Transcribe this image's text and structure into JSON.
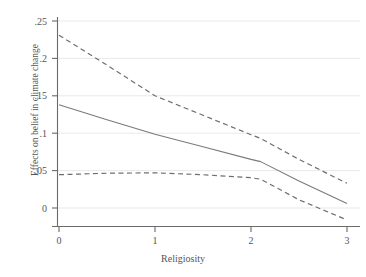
{
  "chart_data": {
    "type": "line",
    "title": "",
    "xlabel": "Religiosity",
    "ylabel": "Effects on belief in climate change",
    "xlim": [
      -0.06,
      3.06
    ],
    "ylim": [
      -0.028,
      0.2585
    ],
    "grid": true,
    "legend": "none",
    "xticks": [
      0,
      1,
      2,
      3
    ],
    "xticklabels": [
      "0",
      "1",
      "2",
      "3"
    ],
    "yticks": [
      0,
      0.05,
      0.1,
      0.15,
      0.2,
      0.25
    ],
    "yticklabels": [
      "0",
      ".05",
      ".1",
      ".15",
      ".2",
      ".25"
    ],
    "x": [
      0,
      0.5,
      1,
      1.5,
      2,
      2.1,
      2.5,
      3
    ],
    "series": [
      {
        "name": "Upper 95% confidence bound",
        "style": "dashed",
        "color": "#6e6e6e",
        "values": [
          0.231,
          0.191,
          0.15,
          0.124,
          0.098,
          0.093,
          0.065,
          0.033
        ]
      },
      {
        "name": "Marginal effect",
        "style": "solid",
        "color": "#7a7a7a",
        "values": [
          0.138,
          0.118,
          0.0985,
          0.082,
          0.065,
          0.062,
          0.036,
          0.006
        ]
      },
      {
        "name": "Lower 95% confidence bound",
        "style": "dashed",
        "color": "#6e6e6e",
        "values": [
          0.0445,
          0.0465,
          0.047,
          0.0445,
          0.0405,
          0.0385,
          0.011,
          -0.016
        ]
      }
    ]
  },
  "axis": {
    "x_title": "Religiosity",
    "y_title": "Effects on belief in climate change",
    "x_tick_labels": [
      "0",
      "1",
      "2",
      "3"
    ],
    "y_tick_labels": [
      ".25",
      ".2",
      ".15",
      ".1",
      ".05",
      "0"
    ]
  },
  "colors": {
    "line": "#7a7a7a",
    "dash": "#6e6e6e",
    "grid": "#e9e9e9",
    "axis": "#6a6a6a",
    "text": "#555555",
    "background": "#ffffff"
  }
}
